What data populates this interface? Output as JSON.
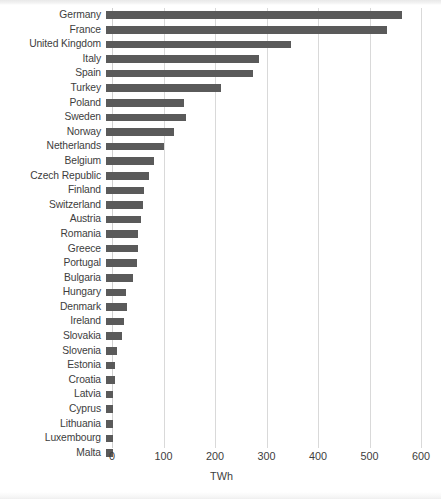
{
  "chart_data": {
    "type": "bar",
    "orientation": "horizontal",
    "title": "",
    "xlabel": "TWh",
    "ylabel": "",
    "xlim": [
      0,
      600
    ],
    "xticks": [
      0,
      100,
      200,
      300,
      400,
      500,
      600
    ],
    "grid": "vertical",
    "legend": "none",
    "bar_color": "#5a5a5a",
    "gridline_color": "#d9d9d9",
    "text_color": "#3d3d3d",
    "categories": [
      "Germany",
      "France",
      "United Kingdom",
      "Italy",
      "Spain",
      "Turkey",
      "Poland",
      "Sweden",
      "Norway",
      "Netherlands",
      "Belgium",
      "Czech Republic",
      "Finland",
      "Switzerland",
      "Austria",
      "Romania",
      "Greece",
      "Portugal",
      "Bulgaria",
      "Hungary",
      "Denmark",
      "Ireland",
      "Slovakia",
      "Slovenia",
      "Estonia",
      "Croatia",
      "Latvia",
      "Cyprus",
      "Lithuania",
      "Luxembourg",
      "Malta"
    ],
    "values": [
      564,
      534,
      347,
      285,
      274,
      212,
      140,
      143,
      120,
      101,
      82,
      72,
      63,
      61,
      57,
      50,
      51,
      48,
      41,
      28,
      30,
      23,
      20,
      9,
      5,
      5,
      2,
      2,
      2,
      2,
      1
    ]
  }
}
